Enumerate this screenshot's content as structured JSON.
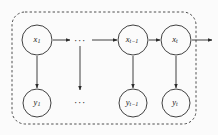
{
  "diagram": {
    "type": "probabilistic-graphical-model",
    "background_color": "#fbfbfb",
    "stroke_color": "#2b2b2b",
    "plate_color": "#3a3a3a",
    "plate": {
      "label": "",
      "x": 12,
      "y": 12,
      "width": 184,
      "height": 112,
      "corner_radius": 13,
      "dashed": true
    },
    "nodes": {
      "hidden": [
        {
          "id": "x1",
          "base": "x",
          "sub": "1",
          "cx": 37,
          "cy": 40,
          "r": 15
        },
        {
          "id": "xtm1",
          "base": "x",
          "sub": "t−1",
          "cx": 133,
          "cy": 40,
          "r": 15
        },
        {
          "id": "xt",
          "base": "x",
          "sub": "t",
          "cx": 176,
          "cy": 40,
          "r": 15
        }
      ],
      "observed": [
        {
          "id": "y1",
          "base": "y",
          "sub": "1",
          "cx": 37,
          "cy": 103,
          "r": 14
        },
        {
          "id": "ytm1",
          "base": "y",
          "sub": "t−1",
          "cx": 133,
          "cy": 103,
          "r": 14
        },
        {
          "id": "yt",
          "base": "y",
          "sub": "t",
          "cx": 176,
          "cy": 103,
          "r": 14
        }
      ]
    },
    "ellipses": [
      {
        "id": "top-ellipsis",
        "text": "···",
        "x": 80,
        "y": 41
      },
      {
        "id": "bottom-ellipsis",
        "text": "···",
        "x": 80,
        "y": 103
      }
    ],
    "edges": [
      {
        "id": "x1-to-dots",
        "x1": 53,
        "y1": 40,
        "x2": 70,
        "y2": 40,
        "dir": "right"
      },
      {
        "id": "dots-to-xtm1",
        "x1": 92,
        "y1": 40,
        "x2": 117,
        "y2": 40,
        "dir": "right"
      },
      {
        "id": "xtm1-to-xt",
        "x1": 149,
        "y1": 40,
        "x2": 160,
        "y2": 40,
        "dir": "right"
      },
      {
        "id": "xt-to-outside",
        "x1": 192,
        "y1": 40,
        "x2": 212,
        "y2": 40,
        "dir": "right"
      },
      {
        "id": "x1-to-y1",
        "x1": 37,
        "y1": 56,
        "x2": 37,
        "y2": 88,
        "dir": "down"
      },
      {
        "id": "mid-chain-down",
        "x1": 80,
        "y1": 46,
        "x2": 80,
        "y2": 90,
        "dir": "down"
      },
      {
        "id": "xtm1-to-ytm1",
        "x1": 133,
        "y1": 56,
        "x2": 133,
        "y2": 88,
        "dir": "down"
      },
      {
        "id": "xt-to-yt",
        "x1": 176,
        "y1": 56,
        "x2": 176,
        "y2": 88,
        "dir": "down"
      }
    ]
  }
}
